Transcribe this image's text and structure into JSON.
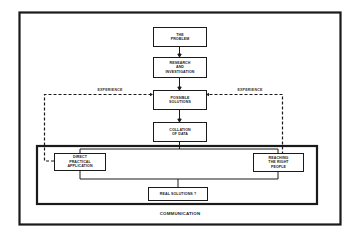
{
  "diagram": {
    "type": "flowchart",
    "frame_color": "#1a1a1a",
    "nodes": {
      "problem": "THE\nPROBLEM",
      "research": "RESEARCH\nAND\nINVESTIGATION",
      "possible_solutions": "POSSIBLE\nSOLUTIONS",
      "collation": "COLLATION\nOF DATA",
      "direct_application": "DIRECT\nPRACTICAL\nAPPLICATION",
      "right_people": "REACHING\nTHE RIGHT\nPEOPLE",
      "real_solutions": "REAL SOLUTIONS ?"
    },
    "edge_labels": {
      "experience_left": "EXPERIENCE",
      "experience_right": "EXPERIENCE"
    },
    "group_label": "COMMUNICATION",
    "edges": [
      {
        "from": "problem",
        "to": "research",
        "style": "solid"
      },
      {
        "from": "research",
        "to": "possible_solutions",
        "style": "solid"
      },
      {
        "from": "possible_solutions",
        "to": "collation",
        "style": "solid"
      },
      {
        "from": "collation",
        "to": "direct_application",
        "style": "solid"
      },
      {
        "from": "collation",
        "to": "right_people",
        "style": "solid"
      },
      {
        "from": "direct_application",
        "to": "real_solutions",
        "style": "solid"
      },
      {
        "from": "right_people",
        "to": "real_solutions",
        "style": "solid"
      },
      {
        "from": "direct_application",
        "to": "possible_solutions",
        "style": "dashed",
        "label": "EXPERIENCE"
      },
      {
        "from": "right_people",
        "to": "possible_solutions",
        "style": "dashed",
        "label": "EXPERIENCE"
      }
    ]
  }
}
